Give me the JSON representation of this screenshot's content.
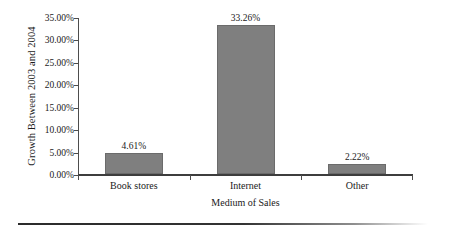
{
  "chart_data": {
    "type": "bar",
    "title": "",
    "subtitle": "",
    "xlabel": "Medium of Sales",
    "ylabel": "Growth Between 2003 and 2004",
    "categories": [
      "Book stores",
      "Internet",
      "Other"
    ],
    "values": [
      4.61,
      33.26,
      2.22
    ],
    "value_labels": [
      "4.61%",
      "33.26%",
      "2.22%"
    ],
    "ylim": [
      0,
      35
    ],
    "ytick_values": [
      0,
      5,
      10,
      15,
      20,
      25,
      30,
      35
    ],
    "ytick_labels": [
      "0.00%",
      "5.00%",
      "10.00%",
      "15.00%",
      "20.00%",
      "25.00%",
      "30.00%",
      "35.00%"
    ],
    "grid": false,
    "legend": false,
    "legend_position": "none",
    "series": [
      {
        "name": "Growth Between 2003 and 2004",
        "values": [
          4.61,
          33.26,
          2.22
        ]
      }
    ],
    "colors": {
      "bar_fill": "#7f7f7f",
      "bar_edge": "#6b6b6b",
      "axis": "#4d4d4d",
      "text": "#1a1a1a",
      "background": "#ffffff",
      "rule": "#2b2b2b"
    }
  }
}
